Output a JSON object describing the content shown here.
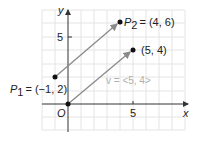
{
  "axes": {
    "x_label": "x",
    "y_label": "y",
    "origin_label": "O",
    "x_tick": "5",
    "y_tick": "5"
  },
  "points": {
    "p1": {
      "name": "P",
      "sub": "1",
      "coords": "= (−1, 2)",
      "x": -1,
      "y": 2
    },
    "p2": {
      "name": "P",
      "sub": "2",
      "coords": "= (4, 6)",
      "x": 4,
      "y": 6
    },
    "v_end": {
      "coords": "(5, 4)",
      "x": 5,
      "y": 4
    },
    "origin": {
      "x": 0,
      "y": 0
    }
  },
  "vector_label": "v = <5, 4>",
  "colors": {
    "grid": "#e4e4e4",
    "axis": "#333333",
    "arrow": "#8a8a8a",
    "point": "#111111",
    "vector_label": "#b0b0b0"
  }
}
